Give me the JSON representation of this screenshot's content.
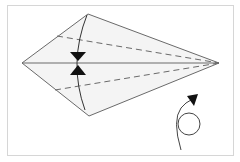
{
  "diagram": {
    "type": "origami-fold-step",
    "colors": {
      "background": "#ffffff",
      "frame": "#d6d6d6",
      "paper_fill": "#f4f4f4",
      "lines": "#6a6a6a",
      "arrows": "#111111"
    },
    "kite": {
      "left": [
        22,
        63
      ],
      "top": [
        88,
        14
      ],
      "right": [
        219,
        63
      ],
      "bottom": [
        89,
        116
      ]
    },
    "center_crease": "solid",
    "valley_folds": [
      {
        "from": [
          57,
          36
        ],
        "to": [
          219,
          63
        ],
        "style": "dashed"
      },
      {
        "from": [
          55,
          90
        ],
        "to": [
          219,
          63
        ],
        "style": "dashed"
      }
    ],
    "fold_arrows": [
      {
        "direction": "down",
        "at": [
          78,
          56
        ]
      },
      {
        "direction": "up",
        "at": [
          78,
          72
        ]
      }
    ],
    "rotate_symbol": {
      "name": "turn-over",
      "center": [
        189,
        124
      ],
      "radius": 11
    }
  }
}
